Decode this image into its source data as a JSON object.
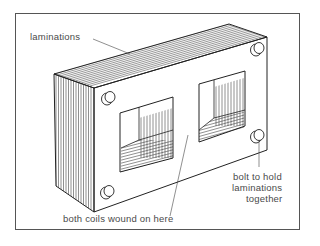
{
  "diagram": {
    "labels": {
      "laminations": "laminations",
      "coils": "both coils wound on here",
      "bolt_line1": "bolt to hold",
      "bolt_line2": "laminations",
      "bolt_line3": "together"
    },
    "colors": {
      "line": "#2a2a2a",
      "frame": "#555555",
      "text": "#4a4a4a",
      "background": "#ffffff"
    }
  }
}
